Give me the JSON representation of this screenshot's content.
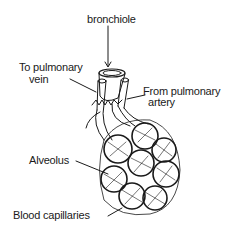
{
  "diagram": {
    "labels": {
      "bronchiole": "bronchiole",
      "to_pulmonary_vein_line1": "To pulmonary",
      "to_pulmonary_vein_line2": "vein",
      "from_pulmonary_artery_line1": "From pulmonary",
      "from_pulmonary_artery_line2": "artery",
      "alveolus": "Alveolus",
      "blood_capillaries": "Blood capillaries"
    }
  }
}
